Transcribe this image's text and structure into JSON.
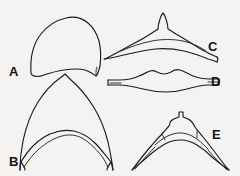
{
  "plate": {
    "title": "Comparative outline drawings of five specimens",
    "background_color": "#f4f3f1",
    "ink_color": "#1b1b1b",
    "width": 240,
    "height": 176,
    "medium": "black line drawing"
  },
  "figures": [
    {
      "key": "A",
      "label": "A",
      "description": "Broad dome-shaped outline with rounded apex and concave lower margin",
      "position": "upper-left",
      "label_position": "left of figure"
    },
    {
      "key": "B",
      "label": "B",
      "description": "Tall triangular outline with pointed apex, flared basal corners and arched inner margin",
      "position": "lower-left",
      "label_position": "lower-left of figure"
    },
    {
      "key": "C",
      "label": "C",
      "description": "Low broad arch with small pointed median peak and tapering lateral arms",
      "position": "upper-right",
      "label_position": "right of figure"
    },
    {
      "key": "D",
      "label": "D",
      "description": "Elongate lens-shaped band with undulating dorsal margin and truncate ends",
      "position": "middle-right",
      "label_position": "right of figure"
    },
    {
      "key": "E",
      "label": "E",
      "description": "Low broad arch with small rectangular median projection and tapering lateral arms",
      "position": "lower-right",
      "label_position": "right of figure"
    }
  ]
}
